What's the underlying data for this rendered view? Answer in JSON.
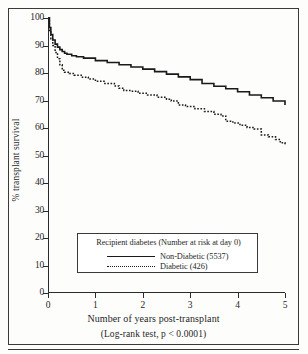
{
  "chart_data": {
    "type": "line",
    "title": "",
    "xlabel": "Number of years post-transplant",
    "ylabel": "% transplant survival",
    "caption": "(Log-rank test, p < 0.0001)",
    "xlim": [
      0,
      5
    ],
    "ylim": [
      0,
      100
    ],
    "xticks": [
      0,
      1,
      2,
      3,
      4,
      5
    ],
    "yticks": [
      0,
      10,
      20,
      30,
      40,
      50,
      60,
      70,
      80,
      90,
      100
    ],
    "grid": false,
    "legend_position": "lower-center",
    "legend_title": "Recipient diabetes (Number at risk at day 0)",
    "series": [
      {
        "name": "Non-Diabetic",
        "n_at_risk": 5537,
        "legend_label": "Non-Diabetic (5537)",
        "style": "solid",
        "x": [
          0,
          0.03,
          0.06,
          0.1,
          0.15,
          0.2,
          0.25,
          0.3,
          0.35,
          0.4,
          0.5,
          0.6,
          0.75,
          1.0,
          1.25,
          1.5,
          1.75,
          2.0,
          2.25,
          2.5,
          2.75,
          3.0,
          3.25,
          3.5,
          3.75,
          4.0,
          4.25,
          4.5,
          4.75,
          5.0
        ],
        "y": [
          100,
          96.5,
          94.0,
          92.0,
          90.5,
          89.4,
          88.5,
          87.8,
          87.2,
          86.8,
          86.3,
          85.9,
          85.4,
          84.5,
          83.8,
          83.0,
          82.2,
          81.4,
          80.5,
          79.6,
          78.6,
          77.6,
          76.2,
          75.2,
          74.3,
          73.2,
          72.0,
          71.0,
          69.8,
          68.4
        ]
      },
      {
        "name": "Diabetic",
        "n_at_risk": 426,
        "legend_label": "Diabetic   (426)",
        "style": "dotted",
        "x": [
          0,
          0.03,
          0.06,
          0.1,
          0.15,
          0.2,
          0.25,
          0.3,
          0.35,
          0.45,
          0.55,
          0.7,
          0.85,
          1.0,
          1.2,
          1.4,
          1.5,
          1.6,
          1.75,
          1.9,
          2.1,
          2.3,
          2.5,
          2.6,
          2.75,
          2.9,
          3.1,
          3.3,
          3.5,
          3.65,
          3.75,
          3.9,
          4.05,
          4.2,
          4.35,
          4.5,
          4.65,
          4.8,
          4.9,
          5.0
        ],
        "y": [
          100,
          95.5,
          92.5,
          90.0,
          87.5,
          85.2,
          83.0,
          81.0,
          80.3,
          79.8,
          79.2,
          78.5,
          77.8,
          77.0,
          76.2,
          75.3,
          74.5,
          73.6,
          73.4,
          72.6,
          72.0,
          71.2,
          70.5,
          69.8,
          68.4,
          67.8,
          67.0,
          66.0,
          65.0,
          64.4,
          62.5,
          61.8,
          61.0,
          60.2,
          59.6,
          57.5,
          56.8,
          55.8,
          54.6,
          53.8
        ]
      }
    ]
  },
  "axis": {
    "y_tick_labels": [
      "100",
      "90",
      "80",
      "70",
      "60",
      "50",
      "40",
      "30",
      "20",
      "10",
      "0"
    ],
    "x_tick_labels": [
      "0",
      "1",
      "2",
      "3",
      "4",
      "5"
    ]
  }
}
